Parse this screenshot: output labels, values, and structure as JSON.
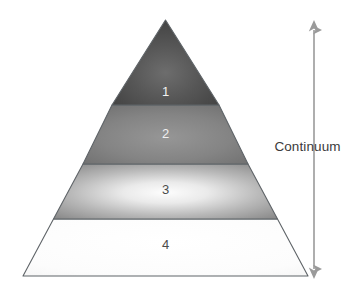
{
  "diagram": {
    "type": "pyramid",
    "title": "",
    "levels": [
      {
        "label": "1",
        "rank": 1,
        "position": "top",
        "fill_center": "#6a6a6a",
        "fill_edge": "#3f3f3f",
        "text_color": "#f2f2f2"
      },
      {
        "label": "2",
        "rank": 2,
        "position": "upper-middle",
        "fill_center": "#8e8e8e",
        "fill_edge": "#6e6e6e",
        "text_color": "#efefef"
      },
      {
        "label": "3",
        "rank": 3,
        "position": "lower-middle",
        "fill_center": "#fbfbfb",
        "fill_edge": "#8a8a8a",
        "text_color": "#4b4b4b"
      },
      {
        "label": "4",
        "rank": 4,
        "position": "base",
        "fill_center": "#ffffff",
        "fill_edge": "#f7f7f7",
        "text_color": "#4b4b4b"
      }
    ],
    "outline_color": "#5f6468",
    "divider_color": "#5f6468"
  },
  "annotation": {
    "continuum_label": "Continuum",
    "arrow": {
      "name": "double-headed-vertical-arrow",
      "direction": "both",
      "color": "#9a9a9a",
      "top_head": "up",
      "bottom_head": "down"
    }
  },
  "colors": {
    "background": "#ffffff",
    "label_text": "#3b3b3b",
    "arrow": "#9a9a9a"
  }
}
